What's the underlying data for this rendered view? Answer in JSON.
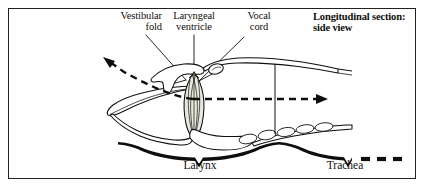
{
  "figure": {
    "title_heading": "Longitudinal section:\nside view",
    "background_color": "#ffffff",
    "frame_color": "#23211f",
    "ink_color": "#100e0c",
    "cartilage_fill": "#ffffff",
    "vocal_cord_fill": "#e9e8df"
  },
  "callouts": [
    {
      "name": "vestibular-fold",
      "text": "Vestibular\nfold"
    },
    {
      "name": "laryngeal-ventricle",
      "text": "Laryngeal\nventricle"
    },
    {
      "name": "vocal-cord",
      "text": "Vocal\ncord"
    }
  ],
  "regions": [
    {
      "name": "larynx",
      "label": "Larynx"
    },
    {
      "name": "trachea",
      "label": "Trachea"
    }
  ],
  "airflow": {
    "name": "airflow-path",
    "style": "dashed",
    "arrowheads": 2,
    "direction_left": "up-and-out",
    "direction_right": "down-the-trachea"
  }
}
